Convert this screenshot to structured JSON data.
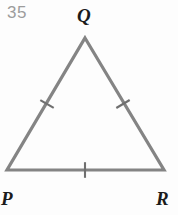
{
  "figure": {
    "problem_number": "35",
    "shape_type": "triangle",
    "shape_name": "PQR",
    "stroke_color": "#848484",
    "stroke_width": 3.2,
    "background_color": "#fdfdfd",
    "label_color": "#1b1b1b",
    "problem_number_color": "#9c9c9c",
    "vertices": [
      {
        "id": "q",
        "label": "Q",
        "x": 85,
        "y": 38
      },
      {
        "id": "p",
        "label": "P",
        "x": 7,
        "y": 170
      },
      {
        "id": "r",
        "label": "R",
        "x": 164,
        "y": 170
      }
    ],
    "sides": [
      {
        "id": "pq",
        "from": "P",
        "to": "Q",
        "tick_count": 1,
        "tick_center_x": 47,
        "tick_center_y": 104
      },
      {
        "id": "qr",
        "from": "Q",
        "to": "R",
        "tick_count": 1,
        "tick_center_x": 123,
        "tick_center_y": 104
      },
      {
        "id": "pr",
        "from": "P",
        "to": "R",
        "tick_count": 1,
        "tick_center_x": 85,
        "tick_center_y": 170
      }
    ],
    "congruence_note": "single tick on all three sides"
  }
}
